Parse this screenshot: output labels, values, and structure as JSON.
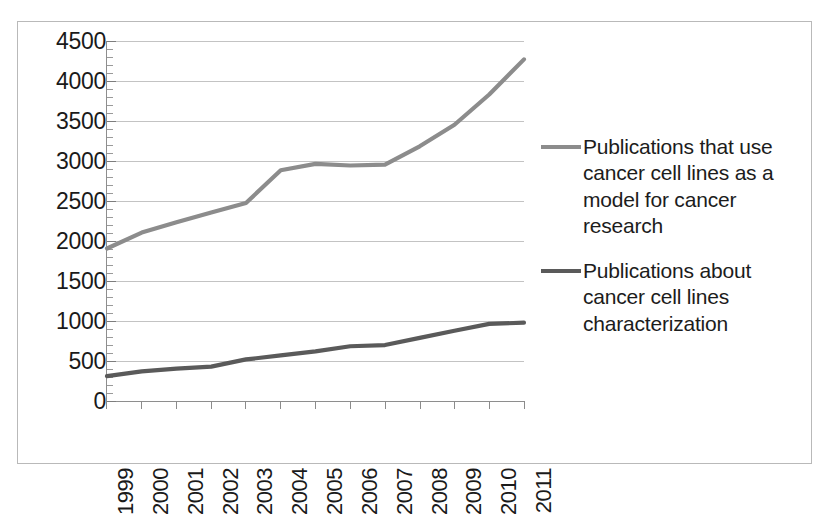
{
  "chart_data": {
    "type": "line",
    "title": "",
    "xlabel": "",
    "ylabel": "",
    "categories": [
      "1999",
      "2000",
      "2001",
      "2002",
      "2003",
      "2004",
      "2005",
      "2006",
      "2007",
      "2008",
      "2009",
      "2010",
      "2011"
    ],
    "ylim": [
      0,
      4500
    ],
    "ytick_step": 500,
    "yticks": [
      "4500",
      "4000",
      "3500",
      "3000",
      "2500",
      "2000",
      "1500",
      "1000",
      "500",
      "0"
    ],
    "ytick_values": [
      4500,
      4000,
      3500,
      3000,
      2500,
      2000,
      1500,
      1000,
      500,
      0
    ],
    "grid": true,
    "legend_position": "right",
    "series": [
      {
        "name": "Publications that use cancer cell lines as a model for cancer research",
        "color": "#8c8c8c",
        "values": [
          1900,
          2100,
          2230,
          2350,
          2470,
          2880,
          2960,
          2940,
          2950,
          3180,
          3450,
          3830,
          4270
        ]
      },
      {
        "name": "Publications about cancer cell lines characterization",
        "color": "#5a5a5a",
        "values": [
          300,
          360,
          395,
          420,
          510,
          560,
          610,
          675,
          690,
          780,
          870,
          955,
          970
        ]
      }
    ]
  },
  "legend": {
    "entries": [
      {
        "label": "Publications that use cancer cell lines as a model for cancer research",
        "color": "#8c8c8c"
      },
      {
        "label": "Publications about cancer cell lines characterization",
        "color": "#5a5a5a"
      }
    ]
  },
  "colors": {
    "series_upper": "#8c8c8c",
    "series_lower": "#5a5a5a",
    "gridline": "#c3c3c3",
    "axis": "#8e8e8e",
    "frame": "#b9b9b9",
    "text": "#1a1a1a",
    "background": "#ffffff"
  }
}
